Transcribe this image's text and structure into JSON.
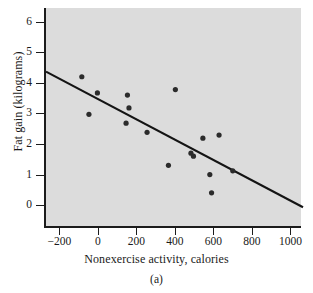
{
  "chart_data": {
    "type": "scatter",
    "title": "",
    "xlabel": "Nonexercise activity, calories",
    "ylabel": "Fat gain (kilograms)",
    "caption": "(a)",
    "xlim": [
      -280,
      1055
    ],
    "ylim": [
      -0.75,
      6.45
    ],
    "xticks": [
      -200,
      0,
      200,
      400,
      600,
      800,
      1000
    ],
    "xticklabels": [
      "−200",
      "0",
      "200",
      "400",
      "600",
      "800",
      "1000"
    ],
    "yticks": [
      0,
      1,
      2,
      3,
      4,
      5,
      6
    ],
    "yticklabels": [
      "0",
      "1",
      "2",
      "3",
      "4",
      "5",
      "6"
    ],
    "grid": false,
    "legend": null,
    "plot_background": "#dcdcdc",
    "marker_color": "#2b2b2b",
    "line_color": "#141414",
    "points": [
      {
        "x": -94,
        "y": 4.2
      },
      {
        "x": -57,
        "y": 2.97
      },
      {
        "x": -13,
        "y": 3.67
      },
      {
        "x": 143,
        "y": 3.6
      },
      {
        "x": 151,
        "y": 3.18
      },
      {
        "x": 136,
        "y": 2.68
      },
      {
        "x": 245,
        "y": 2.38
      },
      {
        "x": 392,
        "y": 3.78
      },
      {
        "x": 356,
        "y": 1.3
      },
      {
        "x": 473,
        "y": 1.7
      },
      {
        "x": 486,
        "y": 1.6
      },
      {
        "x": 535,
        "y": 2.19
      },
      {
        "x": 571,
        "y": 1.0
      },
      {
        "x": 580,
        "y": 0.4
      },
      {
        "x": 619,
        "y": 2.29
      },
      {
        "x": 690,
        "y": 1.12
      }
    ],
    "fit_line": {
      "x_start": -280,
      "y_start": 4.37,
      "x_end": 1055,
      "y_end": -0.07
    }
  }
}
